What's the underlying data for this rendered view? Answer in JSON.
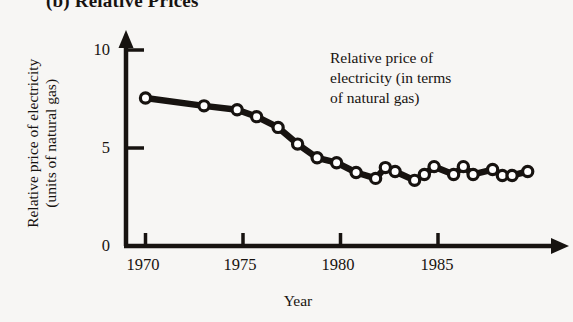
{
  "figure": {
    "panel_title": "(b) Relative Prices"
  },
  "annotation": {
    "line1": "Relative price of",
    "line2": "electricity (in terms",
    "line3": "of natural gas)"
  },
  "axes": {
    "y_label_line1": "Relative price of electricity",
    "y_label_line2": "(units of natural gas)",
    "x_label": "Year",
    "x_ticks": [
      "1970",
      "1975",
      "1980",
      "1985"
    ],
    "y_ticks": [
      "0",
      "5",
      "10"
    ]
  },
  "colors": {
    "ink": "#171310",
    "background": "#f7f6f4",
    "marker_fill": "#ffffff"
  },
  "chart_data": {
    "type": "line",
    "title": "(b) Relative Prices",
    "xlabel": "Year",
    "ylabel": "Relative price of electricity (units of natural gas)",
    "xlim": [
      1969.2,
      1990.8
    ],
    "ylim": [
      0,
      10.8
    ],
    "xticks": [
      1970,
      1975,
      1980,
      1985
    ],
    "yticks": [
      0,
      5,
      10
    ],
    "grid": false,
    "legend": null,
    "annotations": [
      {
        "text": "Relative price of electricity (in terms of natural gas)",
        "x": 1982.8,
        "y": 8.2
      }
    ],
    "series": [
      {
        "name": "Relative price of electricity (in terms of natural gas)",
        "marker": "open-circle",
        "x": [
          1970,
          1973,
          1974.7,
          1975.7,
          1976.8,
          1977.8,
          1978.8,
          1979.8,
          1980.8,
          1981.8,
          1982.3,
          1982.8,
          1983.8,
          1984.3,
          1984.8,
          1985.8,
          1986.3,
          1986.8,
          1987.8,
          1988.3,
          1988.8,
          1989.6
        ],
        "y": [
          7.55,
          7.15,
          6.95,
          6.6,
          6.05,
          5.2,
          4.5,
          4.25,
          3.75,
          3.45,
          4.0,
          3.8,
          3.35,
          3.65,
          4.05,
          3.65,
          4.05,
          3.65,
          3.9,
          3.6,
          3.6,
          3.8
        ]
      }
    ]
  }
}
